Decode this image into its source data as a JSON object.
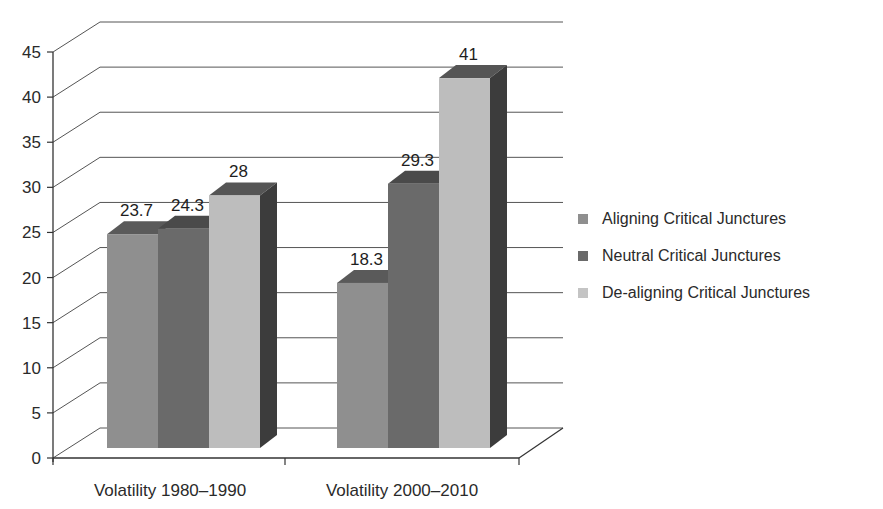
{
  "chart_data": {
    "type": "bar",
    "style": "3d-clustered-column",
    "title": "",
    "xlabel": "",
    "ylabel": "",
    "ylim": [
      0,
      45
    ],
    "yticks": [
      0,
      5,
      10,
      15,
      20,
      25,
      30,
      35,
      40,
      45
    ],
    "grid": true,
    "legend_position": "right",
    "categories": [
      "Volatility 1980–1990",
      "Volatility 2000–2010"
    ],
    "series": [
      {
        "name": "Aligning Critical Junctures",
        "values": [
          23.7,
          18.3
        ],
        "color": "#8f8f8f",
        "top": "#5a5a5a",
        "side": "#4a4a4a"
      },
      {
        "name": "Neutral Critical Junctures",
        "values": [
          24.3,
          29.3
        ],
        "color": "#6a6a6a",
        "top": "#4a4a4a",
        "side": "#3e3e3e"
      },
      {
        "name": "De-aligning Critical Junctures",
        "values": [
          28,
          41
        ],
        "color": "#bdbdbd",
        "top": "#555555",
        "side": "#3c3c3c"
      }
    ],
    "data_labels": [
      [
        "23.7",
        "18.3"
      ],
      [
        "24.3",
        "29.3"
      ],
      [
        "28",
        "41"
      ]
    ]
  },
  "legend": {
    "items": [
      {
        "label": "Aligning Critical Junctures",
        "color": "#8f8f8f"
      },
      {
        "label": "Neutral Critical Junctures",
        "color": "#6a6a6a"
      },
      {
        "label": "De-aligning Critical Junctures",
        "color": "#c4c4c4"
      }
    ]
  }
}
